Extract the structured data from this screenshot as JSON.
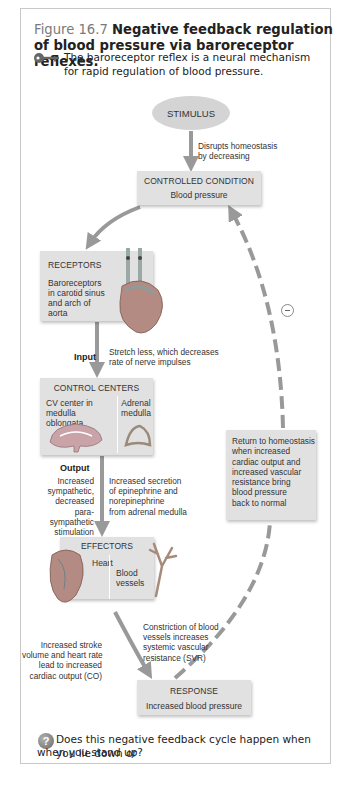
{
  "figure": {
    "number": "Figure 16.7",
    "title": "Negative feedback regulation of blood pressure via baroreceptor reflexes.",
    "key_icon": "key-icon",
    "key_text": "The baroreceptor reflex is a neural mechanism for rapid regulation of blood pressure."
  },
  "diagram": {
    "stimulus": "STIMULUS",
    "stimulus_note": [
      "Disrupts homeostasis",
      "by decreasing"
    ],
    "controlled_condition": {
      "heading": "CONTROLLED CONDITION",
      "sub": "Blood pressure"
    },
    "receptors": {
      "heading": "RECEPTORS",
      "sub": [
        "Baroreceptors",
        "in carotid sinus",
        "and arch of aorta"
      ],
      "image": "heart-with-carotid-arteries"
    },
    "input": {
      "label": "Input",
      "note": [
        "Stretch less, which decreases",
        "rate of nerve impulses"
      ]
    },
    "control_centers": {
      "heading": "CONTROL CENTERS",
      "col1": [
        "CV center in",
        "medulla oblongata"
      ],
      "col2": [
        "Adrenal",
        "medulla"
      ],
      "images": [
        "brain-medulla",
        "adrenal-gland"
      ]
    },
    "output": {
      "label": "Output",
      "left_note": [
        "Increased",
        "sympathetic,",
        "decreased para-",
        "sympathetic",
        "stimulation"
      ],
      "right_note": [
        "Increased secretion",
        "of epinephrine and",
        "norepinephrine",
        "from adrenal medulla"
      ]
    },
    "effectors": {
      "heading": "EFFECTORS",
      "heart": "Heart",
      "vessels": [
        "Blood",
        "vessels"
      ],
      "images": [
        "heart",
        "blood-vessel"
      ]
    },
    "effector_notes": {
      "left": [
        "Increased stroke",
        "volume and heart rate",
        "lead to increased",
        "cardiac output (CO)"
      ],
      "right": [
        "Constriction of blood",
        "vessels increases",
        "systemic vascular",
        "resistance (SVR)"
      ]
    },
    "response": {
      "heading": "RESPONSE",
      "sub": "Increased blood pressure"
    },
    "return_note": [
      "Return to homeostasis",
      "when increased",
      "cardiac output and",
      "increased vascular",
      "resistance bring",
      "blood pressure",
      "back to normal"
    ],
    "feedback_sign": "minus-icon"
  },
  "question": {
    "icon": "question-icon",
    "icon_glyph": "?",
    "text_line1": "Does this negative feedback cycle happen when you lie down or",
    "text_line2": "when you stand up?"
  },
  "colors": {
    "box": "#e1e1e1",
    "arrow": "#999999",
    "title_number": "#7a7a7a"
  }
}
